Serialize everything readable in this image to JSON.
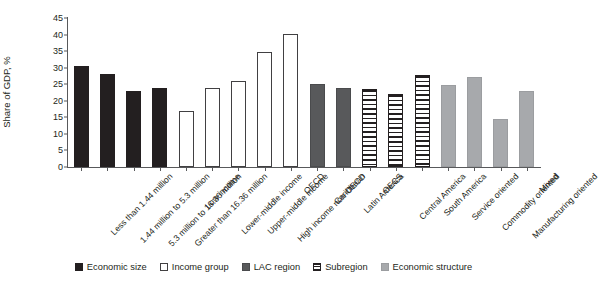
{
  "chart_data": {
    "type": "bar",
    "title": "",
    "xlabel": "",
    "ylabel": "Share of GDP, %",
    "ylim": [
      0,
      45
    ],
    "yticks": [
      0,
      5,
      10,
      15,
      20,
      25,
      30,
      35,
      40,
      45
    ],
    "grid": false,
    "legend_position": "bottom",
    "categories": [
      "Less than 1.44 million",
      "1.44 million to 5.3 million",
      "5.3 million to 16.36 million",
      "Greater than 16.36 million",
      "Low income",
      "Lower-middle income",
      "Upper-middle income",
      "High income non-OECD",
      "OECD",
      "Caribbean",
      "Latin America",
      "OECS",
      "Central America",
      "South America",
      "Service oriented",
      "Commodity oriented",
      "Manufacturing oriented",
      "Mixed"
    ],
    "values": [
      30.5,
      28.1,
      23.0,
      23.9,
      16.8,
      23.9,
      26.1,
      34.8,
      40.1,
      25.0,
      23.8,
      23.5,
      22.0,
      27.8,
      24.7,
      27.3,
      14.5,
      23.0
    ],
    "groups": [
      "economic-size",
      "economic-size",
      "economic-size",
      "economic-size",
      "income-group",
      "income-group",
      "income-group",
      "income-group",
      "income-group",
      "lac-region",
      "lac-region",
      "subregion",
      "subregion",
      "subregion",
      "economic-structure",
      "economic-structure",
      "economic-structure",
      "economic-structure"
    ],
    "legend": [
      {
        "key": "economic-size",
        "label": "Economic size",
        "color": "#231f20",
        "fill": "solid-black"
      },
      {
        "key": "income-group",
        "label": "Income group",
        "color": "#ffffff",
        "fill": "open-white"
      },
      {
        "key": "lac-region",
        "label": "LAC region",
        "color": "#58595b",
        "fill": "solid-dark-gray"
      },
      {
        "key": "subregion",
        "label": "Subregion",
        "color": "#231f20",
        "fill": "horizontal-hatch"
      },
      {
        "key": "economic-structure",
        "label": "Economic structure",
        "color": "#a7a9ac",
        "fill": "solid-light-gray"
      }
    ]
  }
}
